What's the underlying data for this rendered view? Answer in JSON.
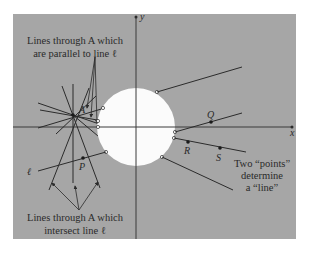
{
  "figure": {
    "background": "#ffffff",
    "panel_color": "#a6a6a6",
    "disk_color": "#fbfbfb",
    "line_color": "#2b2b2b",
    "axes": {
      "x_label": "x",
      "y_label": "y"
    },
    "points": {
      "A": "A",
      "P": "P",
      "Q": "Q",
      "R": "R",
      "S": "S"
    },
    "line_label": "ℓ",
    "annotations": {
      "parallel_line1": "Lines through A which",
      "parallel_line2": "are parallel to line ℓ",
      "intersect_line1": "Lines through A which",
      "intersect_line2": "intersect line ℓ",
      "two_points_line1": "Two “points”",
      "two_points_line2": "determine",
      "two_points_line3": "a “line”"
    }
  }
}
